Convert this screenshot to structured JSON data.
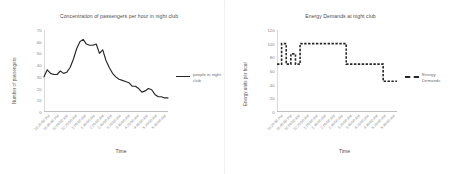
{
  "charts": [
    {
      "title": "Concentration of passengers per hour in night club",
      "ylabel": "Number of passengers",
      "xlabel": "Time",
      "legend": "people in night club",
      "legend_style": "solid"
    },
    {
      "title": "Energy Demands at night club",
      "ylabel": "Energy units per hour",
      "xlabel": "Time",
      "legend": "Energy Demands",
      "legend_style": "dashed"
    }
  ],
  "chart_data": [
    {
      "type": "line",
      "title": "Concentration of passengers per hour in night club",
      "xlabel": "Time",
      "ylabel": "Number of passengers",
      "ylim": [
        0,
        70
      ],
      "yticks": [
        0,
        10,
        20,
        30,
        40,
        50,
        60,
        70
      ],
      "grid": false,
      "legend_position": "right",
      "series": [
        {
          "name": "people in night club",
          "style": "solid",
          "color": "#262626",
          "values": [
            30,
            36,
            33,
            32,
            32,
            35,
            33,
            34,
            38,
            45,
            54,
            60,
            62,
            58,
            57,
            57,
            58,
            50,
            53,
            44,
            38,
            33,
            30,
            28,
            27,
            26,
            25,
            22,
            22,
            20,
            17,
            18,
            20,
            19,
            15,
            13,
            13,
            12,
            12
          ]
        }
      ],
      "categories": [
        "11:20:00 PM",
        "11:40:00 PM",
        "12:00:00 AM",
        "12:20:00 AM",
        "12:40:00 AM",
        "1:00:00 AM",
        "1:20:00 AM",
        "1:40:00 AM",
        "2:00:00 AM",
        "2:20:00 AM",
        "2:40:00 AM",
        "3:00:00 AM",
        "3:20:00 AM",
        "3:40:00 AM",
        "4:00:00 AM",
        "4:20:00 AM",
        "4:40:00 AM",
        "5:00:00 AM",
        "5:20:00 AM",
        "5:40:00 AM"
      ],
      "tick_labels": [
        "11:20:00 PM",
        "11:40:00 PM",
        "12:00:00 AM",
        "12:20:00 AM",
        "1:00:00 AM",
        "1:40:00 AM",
        "2:00:00 AM",
        "2:40:00 AM",
        "3:20:00 AM",
        "3:40:00 AM",
        "4:20:00 AM",
        "4:40:00 AM",
        "5:20:00 AM",
        "5:40:00 AM"
      ]
    },
    {
      "type": "line",
      "title": "Energy Demands at night club",
      "xlabel": "Time",
      "ylabel": "Energy units per hour",
      "ylim": [
        0,
        120
      ],
      "yticks": [
        0,
        20,
        40,
        60,
        80,
        100,
        120
      ],
      "grid": false,
      "legend_position": "right",
      "series": [
        {
          "name": "Energy Demands",
          "style": "dashed",
          "color": "#262626",
          "values": [
            70,
            100,
            70,
            85,
            70,
            100,
            100,
            100,
            100,
            100,
            100,
            100,
            100,
            100,
            100,
            70,
            70,
            70,
            70,
            70,
            70,
            70,
            70,
            45,
            45,
            45,
            45
          ]
        }
      ],
      "categories": [
        "11:20:00 PM",
        "11:40:00 PM",
        "12:00:00 AM",
        "12:20:00 AM",
        "12:40:00 AM",
        "1:00:00 AM",
        "1:20:00 AM",
        "1:40:00 AM",
        "2:00:00 AM",
        "2:20:00 AM",
        "2:40:00 AM",
        "3:00:00 AM",
        "3:20:00 AM",
        "3:40:00 AM",
        "4:00:00 AM",
        "4:20:00 AM",
        "4:40:00 AM",
        "5:00:00 AM",
        "5:20:00 AM",
        "5:40:00 AM"
      ],
      "tick_labels": [
        "11:20:00 PM",
        "11:40:00 PM",
        "12:00:00 AM",
        "12:20:00 AM",
        "1:00:00 AM",
        "1:40:00 AM",
        "2:00:00 AM",
        "2:40:00 AM",
        "3:20:00 AM",
        "3:40:00 AM",
        "4:20:00 AM",
        "4:40:00 AM",
        "5:20:00 AM",
        "5:40:00 AM"
      ]
    }
  ]
}
